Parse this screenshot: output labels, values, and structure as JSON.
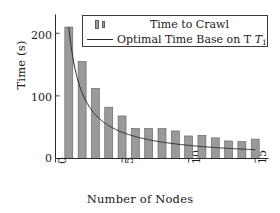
{
  "chart_data": {
    "type": "bar",
    "title": "",
    "xlabel": "Number of Nodes",
    "ylabel": "Time (s)",
    "xlim": [
      0,
      16
    ],
    "ylim": [
      0,
      230
    ],
    "xticks": [
      "0",
      "5",
      "10",
      "15"
    ],
    "xtick_values": [
      0,
      5,
      10,
      15
    ],
    "yticks": [
      "0",
      "100",
      "200"
    ],
    "ytick_values": [
      0,
      100,
      200
    ],
    "grid": false,
    "legend_position": "top-right",
    "categories": [
      1,
      2,
      3,
      4,
      5,
      6,
      7,
      8,
      9,
      10,
      11,
      12,
      13,
      14,
      15
    ],
    "series": [
      {
        "name": "Time to Crawl",
        "type": "bar",
        "color": "#9a9a9a",
        "edge_color": "#5f5f5f",
        "values": [
          210,
          155,
          112,
          82,
          68,
          48,
          48,
          48,
          44,
          36,
          37,
          33,
          28,
          27,
          31
        ]
      },
      {
        "name": "Optimal Time Base on T1",
        "type": "line",
        "color": "#2a2a2a",
        "x": [
          1,
          2,
          3,
          4,
          5,
          6,
          7,
          8,
          9,
          10,
          11,
          12,
          13,
          14,
          15
        ],
        "values": [
          210,
          105,
          70,
          52.5,
          42,
          35,
          30,
          26.3,
          23.3,
          21,
          19.1,
          17.5,
          16.2,
          15,
          14
        ]
      }
    ]
  },
  "legend": {
    "entries": [
      {
        "label": "Time to Crawl",
        "key": "bars"
      },
      {
        "label": "Optimal Time Base on T",
        "subscript": "1",
        "key": "line"
      }
    ]
  },
  "axes": {
    "ylabel": "Time (s)",
    "xlabel": "Number of Nodes",
    "ytick_labels": [
      "0",
      "100",
      "200"
    ],
    "xtick_labels": [
      "0",
      "5",
      "10",
      "15"
    ]
  }
}
